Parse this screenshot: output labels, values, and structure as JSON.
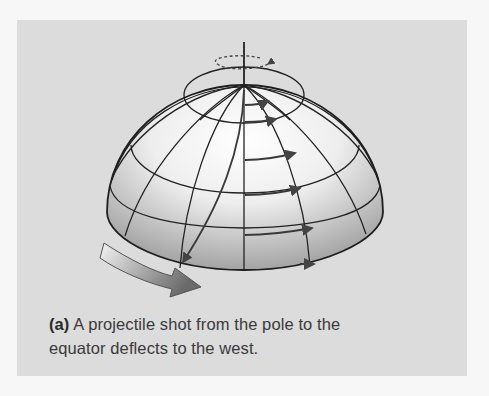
{
  "figure": {
    "panel_label": "(a)",
    "caption_line1": "A projectile shot from the pole to the",
    "caption_line2": "equator deflects to the west.",
    "elements": {
      "hemisphere": "rotating hemisphere with latitude and longitude grid",
      "rotation_axis": "vertical axis through the north pole",
      "rotation_indicator": "dashed ellipse arrow showing rotation",
      "projectile_path": "curved path from pole to equator",
      "deflection_arrows": "short arrows showing eastward surface motion",
      "rotation_arrow": "large curved arrow showing direction of rotation"
    },
    "colors": {
      "panel_bg": "#dcdcdc",
      "page_bg": "#f7f7f7",
      "line": "#222222",
      "arrow": "#555555"
    }
  }
}
